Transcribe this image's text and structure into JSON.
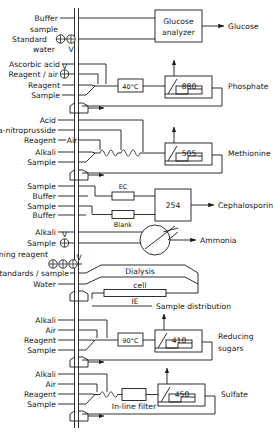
{
  "diagram": {
    "line_color": "#1a1a1a",
    "background_color": "#ffffff"
  },
  "channels": [
    {
      "id": "glucose",
      "output_label": "Glucose",
      "inputs": [
        "Buffer",
        "sample",
        "Standard",
        "water"
      ],
      "valve_label": "V",
      "valve_count": 2,
      "module_label": "Glucose\nanalyzer",
      "module_line1": "Glucose",
      "module_line2": "analyzer"
    },
    {
      "id": "phosphate",
      "output_label": "Phosphate",
      "inputs": [
        "Ascorbic acid",
        "Reagent / air",
        "Reagent",
        "Sample"
      ],
      "valve_label": "V",
      "valve_count": 1,
      "bath_label": "40°C",
      "detector_label": "880"
    },
    {
      "id": "methionine",
      "output_label": "Methionine",
      "inputs": [
        "Acid",
        "Na-nitroprusside",
        "Reagent",
        "Alkali",
        "Sample"
      ],
      "air_label": "Air",
      "detector_label": "505"
    },
    {
      "id": "cephalosporin",
      "output_label": "Cephalosporin",
      "inputs": [
        "Sample",
        "Buffer",
        "Sample",
        "Buffer"
      ],
      "column_label": "EC",
      "blank_label": "Blank",
      "detector_label": "254"
    },
    {
      "id": "ammonia",
      "output_label": "Ammonia",
      "inputs": [
        "Alkali",
        "Sample"
      ],
      "valve_label": "V",
      "valve_count": 1,
      "detector_label": ""
    },
    {
      "id": "sample-distribution",
      "output_label": "Sample distribution",
      "inputs": [
        "Cleaning reagent",
        "Standards / sample",
        "Water"
      ],
      "valve_label": "V",
      "valve_count": 3,
      "dialysis_line1": "Dialysis",
      "dialysis_line2": "cell",
      "column_label": "IE"
    },
    {
      "id": "reducing-sugars",
      "output_label_line1": "Reducing",
      "output_label_line2": "sugars",
      "inputs": [
        "Alkali",
        "Air",
        "Reagent",
        "Sample"
      ],
      "bath_label": "90°C",
      "detector_label": "410"
    },
    {
      "id": "sulfate",
      "output_label": "Sulfate",
      "inputs": [
        "Alkali",
        "Air",
        "Reagent",
        "Sample"
      ],
      "filter_label": "In-line filter",
      "detector_label": "450"
    }
  ],
  "labels": {
    "buffer": "Buffer",
    "sample_lc": "sample",
    "standard": "Standard",
    "water_lc": "water",
    "v": "V",
    "ascorbic_acid": "Ascorbic acid",
    "reagent_air": "Reagent / air",
    "reagent": "Reagent",
    "sample": "Sample",
    "bath_40": "40°C",
    "det_880": "880",
    "out_glucose": "Glucose",
    "mod_glucose_1": "Glucose",
    "mod_glucose_2": "analyzer",
    "out_phosphate": "Phosphate",
    "acid": "Acid",
    "na_nitroprusside": "Na-nitroprusside",
    "air": "Air",
    "alkali": "Alkali",
    "det_505": "505",
    "out_methionine": "Methionine",
    "ec": "EC",
    "blank": "Blank",
    "det_254": "254",
    "out_cephalosporin": "Cephalosporin",
    "out_ammonia": "Ammonia",
    "cleaning_reagent": "Cleaning reagent",
    "standards_sample": "Standards / sample",
    "water": "Water",
    "dialysis": "Dialysis",
    "cell": "cell",
    "ie": "IE",
    "sample_distribution": "Sample  distribution",
    "bath_90": "90°C",
    "det_410": "410",
    "out_reducing": "Reducing",
    "out_sugars": "sugars",
    "in_line_filter": "In-line filter",
    "det_450": "450",
    "out_sulfate": "Sulfate"
  }
}
